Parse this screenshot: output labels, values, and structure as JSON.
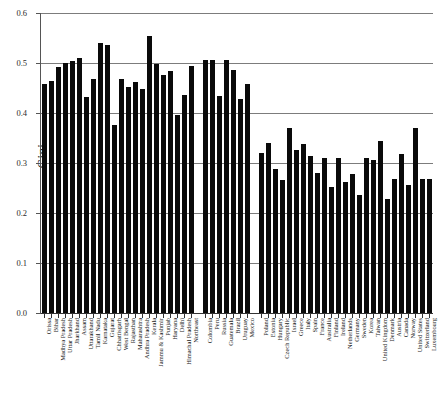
{
  "chart_data": {
    "type": "bar",
    "title": "",
    "xlabel": "",
    "ylabel": "Gini",
    "ylim": [
      0.0,
      0.6
    ],
    "ytick_labels": [
      "0.0",
      "0.1",
      "0.2",
      "0.3",
      "0.4",
      "0.5",
      "0.6"
    ],
    "ytick_values": [
      0.0,
      0.1,
      0.2,
      0.3,
      0.4,
      0.5,
      0.6
    ],
    "grid": true,
    "legend": "none",
    "bar_color": "#0a0a0a",
    "groups": [
      {
        "name": "Indian states",
        "categories": [
          "Orissa",
          "Bihar",
          "Madhya Pradesh",
          "Uttar Pradesh",
          "Jharkhand",
          "Assam",
          "Uttarakhand",
          "Tamil Nadu",
          "Karnataka",
          "Gujarat",
          "Chhattisgarh",
          "West Bengal",
          "Rajasthan",
          "Maharashtra",
          "Andhra Pradesh",
          "Kerala",
          "Jammu & Kashmir",
          "Punjab",
          "Haryana",
          "Delhi",
          "Himachal Pradesh",
          "Northeast"
        ],
        "values": [
          0.458,
          0.465,
          0.492,
          0.5,
          0.504,
          0.511,
          0.432,
          0.468,
          0.541,
          0.536,
          0.377,
          0.468,
          0.452,
          0.462,
          0.449,
          0.554,
          0.499,
          0.477,
          0.484,
          0.397,
          0.437,
          0.494
        ]
      },
      {
        "name": "Latin America and Russia",
        "categories": [
          "Colombia",
          "Peru",
          "Russia",
          "Guatemala",
          "Brazil",
          "Uruguay",
          "Mexico"
        ],
        "values": [
          0.507,
          0.506,
          0.435,
          0.506,
          0.487,
          0.428,
          0.459
        ]
      },
      {
        "name": "OECD and others",
        "categories": [
          "Poland",
          "Estonia",
          "Hungary",
          "Czech Republic",
          "Israel",
          "Greece",
          "Italy",
          "Spain",
          "France",
          "Australia",
          "Finland",
          "Ireland",
          "Netherlands",
          "Germany",
          "Sweden",
          "Korea",
          "Taiwan",
          "United Kingdom",
          "Denmark",
          "Austria",
          "Canada",
          "Norway",
          "United States",
          "Switzerland",
          "Luxembourg"
        ],
        "values": [
          0.32,
          0.34,
          0.288,
          0.266,
          0.37,
          0.327,
          0.338,
          0.315,
          0.281,
          0.311,
          0.252,
          0.311,
          0.263,
          0.278,
          0.237,
          0.311,
          0.306,
          0.345,
          0.229,
          0.269,
          0.318,
          0.256,
          0.371,
          0.268,
          0.268
        ]
      }
    ]
  }
}
